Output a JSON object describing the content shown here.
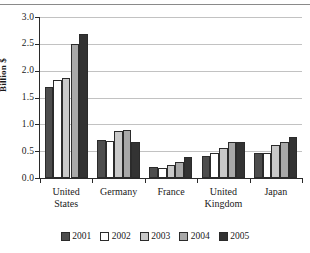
{
  "chart_data": {
    "type": "bar",
    "title": "",
    "xlabel": "",
    "ylabel": "Billion $",
    "ylim": [
      0.0,
      3.0
    ],
    "ytick_labels": [
      "0.0",
      "0.5",
      "1.0",
      "1.5",
      "2.0",
      "2.5",
      "3.0"
    ],
    "ytick_values": [
      0.0,
      0.5,
      1.0,
      1.5,
      2.0,
      2.5,
      3.0
    ],
    "grid": true,
    "legend_position": "bottom",
    "categories": [
      "United States",
      "Germany",
      "France",
      "United Kingdom",
      "Japan"
    ],
    "series": [
      {
        "name": "2001",
        "color": "#4d4d4d",
        "values": [
          1.7,
          0.7,
          0.2,
          0.41,
          0.46
        ]
      },
      {
        "name": "2002",
        "color": "#ffffff",
        "values": [
          1.82,
          0.69,
          0.18,
          0.46,
          0.46
        ]
      },
      {
        "name": "2003",
        "color": "#c9c9c9",
        "values": [
          1.87,
          0.88,
          0.25,
          0.56,
          0.61
        ]
      },
      {
        "name": "2004",
        "color": "#a8a8a8",
        "values": [
          2.49,
          0.89,
          0.29,
          0.68,
          0.67
        ]
      },
      {
        "name": "2005",
        "color": "#333333",
        "values": [
          2.69,
          0.68,
          0.39,
          0.675,
          0.77
        ]
      }
    ]
  },
  "legend": {
    "items": [
      {
        "label": "2001"
      },
      {
        "label": "2002"
      },
      {
        "label": "2003"
      },
      {
        "label": "2004"
      },
      {
        "label": "2005"
      }
    ]
  },
  "axis": {
    "y_title": "Billion $"
  },
  "header": {
    "cut_off_text": ""
  }
}
